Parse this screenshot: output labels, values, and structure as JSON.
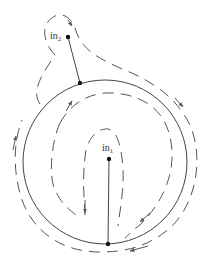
{
  "diagram": {
    "colors": {
      "stroke": "#444444",
      "dash": "#555555",
      "dot": "#111111",
      "background": "#ffffff"
    },
    "circle": {
      "cx": 105,
      "cy": 162,
      "r": 82
    },
    "labels": [
      {
        "id": "in1",
        "base": "in",
        "sub": "1",
        "x": 102,
        "y": 151
      },
      {
        "id": "in2",
        "base": "in",
        "sub": "2",
        "x": 50,
        "y": 39
      }
    ],
    "points": [
      {
        "id": "in1",
        "x": 109,
        "y": 159
      },
      {
        "id": "circle-bottom",
        "x": 108,
        "y": 244
      },
      {
        "id": "in2",
        "x": 68,
        "y": 37
      },
      {
        "id": "circle-top-left",
        "x": 80,
        "y": 83
      }
    ],
    "segments": [
      {
        "from": "in1",
        "to": "circle-bottom"
      },
      {
        "from": "in2",
        "to": "circle-top-left"
      }
    ]
  }
}
